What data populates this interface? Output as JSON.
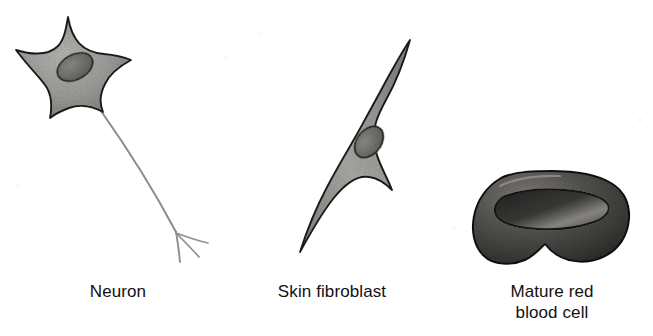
{
  "figure": {
    "background_color": "#ffffff",
    "ink_color": "#111111"
  },
  "labels": {
    "neuron": "Neuron",
    "fibroblast": "Skin fibroblast",
    "red_blood_cell": "Mature red\nblood cell"
  },
  "cells": [
    {
      "name": "neuron",
      "label": "Neuron",
      "shape": "stellate-star-with-axon",
      "parts": [
        "cell body",
        "nucleus",
        "axon",
        "axon terminal branches"
      ],
      "fill_color": "#9b9a98",
      "outline_color": "#1a1a1a",
      "nucleus_color": "#6e6d6b",
      "axon_color": "#8d8d8d",
      "position": {
        "x": 14,
        "y": 16,
        "width": 215,
        "height": 250
      }
    },
    {
      "name": "skin-fibroblast",
      "label": "Skin fibroblast",
      "shape": "spindle-fusiform",
      "parts": [
        "cell body",
        "nucleus"
      ],
      "fill_color": "#a3a2a0",
      "outline_color": "#1a1a1a",
      "nucleus_color": "#74736f",
      "position": {
        "x": 296,
        "y": 38,
        "width": 120,
        "height": 220
      }
    },
    {
      "name": "mature-red-blood-cell",
      "label": "Mature red blood cell",
      "shape": "biconcave-disc",
      "parts": [
        "cell body",
        "central depression"
      ],
      "fill_color": "#4e4c4a",
      "outline_color": "#121212",
      "depression_color": "#2b2a29",
      "position": {
        "x": 476,
        "y": 170,
        "width": 152,
        "height": 96
      }
    }
  ],
  "icons": {
    "neuron_icon": "star-cell-icon",
    "fibroblast_icon": "spindle-cell-icon",
    "rbc_icon": "biconcave-disc-icon"
  }
}
